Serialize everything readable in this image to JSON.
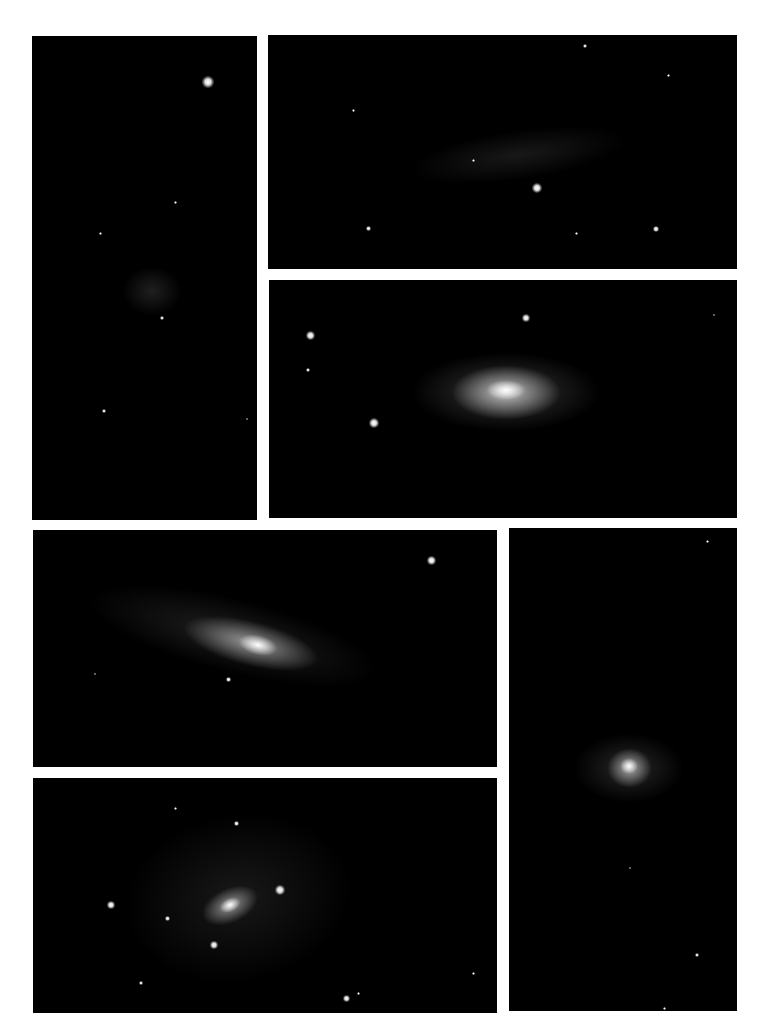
{
  "figure": {
    "background": "#ffffff",
    "panel_background": "#000000",
    "panels": [
      {
        "id": "p1",
        "subject": "faint diffuse galaxy",
        "orientation": "portrait",
        "visible_stars": 5
      },
      {
        "id": "p2",
        "subject": "faint elongated edge-on galaxy",
        "orientation": "landscape",
        "visible_stars": 7
      },
      {
        "id": "p3",
        "subject": "bright elliptical/lenticular galaxy",
        "orientation": "landscape",
        "visible_stars": 5
      },
      {
        "id": "p4",
        "subject": "inclined spiral galaxy with bright core",
        "orientation": "landscape",
        "visible_stars": 3
      },
      {
        "id": "p5",
        "subject": "face-on spiral galaxy with arms",
        "orientation": "landscape",
        "visible_stars": 10
      },
      {
        "id": "p6",
        "subject": "compact elliptical galaxy",
        "orientation": "portrait",
        "visible_stars": 4
      }
    ]
  }
}
